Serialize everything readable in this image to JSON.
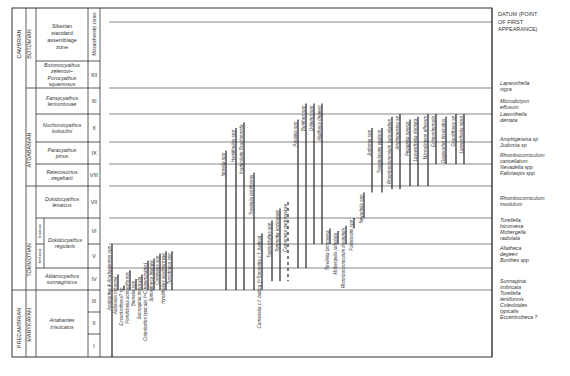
{
  "header": {
    "col_era": "",
    "zone_header": "Siberian standard assemblage zone",
    "miss_header": "Missarzhevsky zones",
    "datum_header": [
      "DATUM (POINT",
      "OF FIRST",
      "APPEARANCE)"
    ]
  },
  "systems": [
    {
      "label": "CAMBRIAN",
      "from": 0,
      "to": 12
    },
    {
      "label": "PRECAMBRIAN",
      "from": 12,
      "to": 15
    }
  ],
  "stages": [
    {
      "label": "BOTOMIAN",
      "from": 0,
      "to": 1
    },
    {
      "label": "ATDABANIAN",
      "from": 1,
      "to": 6
    },
    {
      "label": "TOMMOTIAN",
      "from": 6,
      "to": 10
    },
    {
      "label": "MANYKAYAN",
      "from": 10,
      "to": 15
    }
  ],
  "zones": [
    {
      "name": "Botomocyathus zelenovi–Porocyathus squamosus",
      "numeral": "XII"
    },
    {
      "name": "Fansycyathus lermontovae",
      "numeral": "XI"
    },
    {
      "name": "Nochoroicyathus kokoulini",
      "numeral": "X"
    },
    {
      "name": "Paracyathus pinus",
      "numeral": "IX"
    },
    {
      "name": "Retecoscinus zegebarti",
      "numeral": "VIII"
    },
    {
      "name": "Dokidocyathus lenaicus",
      "numeral": "VII"
    },
    {
      "name": "Dokidocyathus regularis",
      "numeral": "VI"
    },
    {
      "name": "Dokidocyathus regularis",
      "numeral": "V"
    },
    {
      "name": "Aldanocyathus sunnaginicus",
      "numeral": "IV"
    },
    {
      "name": "Anabarites trisulcatus",
      "numeral": "III"
    },
    {
      "name": "Anabarites trisulcatus",
      "numeral": "II"
    },
    {
      "name": "Anabarites trisulcatus",
      "numeral": "I"
    }
  ],
  "sub_zones": [
    "lenaicus",
    "tortuosa"
  ],
  "taxa": [
    {
      "name": "Anabarites & Anabarilentus spp",
      "top": 7,
      "bottom": 12
    },
    {
      "name": "Aldanella rozanovi",
      "top": 8.3,
      "bottom": 9
    },
    {
      "name": "Eccentrotheca? sp",
      "top": 8.8,
      "bottom": 9
    },
    {
      "name": "Fomitchella acinaciformis",
      "top": 8.1,
      "bottom": 9
    },
    {
      "name": "Bemella spp",
      "top": 8.5,
      "bottom": 9
    },
    {
      "name": "Sunnaginia imbricata",
      "top": 8.3,
      "bottom": 9
    },
    {
      "name": "Coleoloides typicalis (=C.trigeminatus)",
      "top": 7.7,
      "bottom": 9
    },
    {
      "name": "Spinulitheca billingsi",
      "top": 7.6,
      "bottom": 9
    },
    {
      "name": "Cobdellus spp",
      "top": 7.4,
      "bottom": 9
    },
    {
      "name": "Hyolithellus vladimirovae",
      "top": 7.3,
      "bottom": 9
    },
    {
      "name": "Turcutheca spp",
      "top": 7.3,
      "bottom": 9
    },
    {
      "name": "Igorella spp",
      "top": 3.4,
      "bottom": 9
    },
    {
      "name": "Hyolithellus spp",
      "top": 2.5,
      "bottom": 9
    },
    {
      "name": "Inarticulate Brachiopoda",
      "top": 2.3,
      "bottom": 9
    },
    {
      "name": "Torellella lentiformis",
      "top": 4.4,
      "bottom": 9
    },
    {
      "name": "Camenella c.f. baltica (=Tommotia c.f. baltica)",
      "top": 6.6,
      "bottom": 9
    },
    {
      "name": "Tugolochiltes spp",
      "top": 6.1,
      "bottom": 8.6
    },
    {
      "name": "Tommotia kozlowskii",
      "top": 5.7,
      "bottom": 8.6
    },
    {
      "name": "Camenella garbowskae",
      "top": 5.5,
      "bottom": 8.6
    },
    {
      "name": "Paralilla spp",
      "top": 2.2,
      "bottom": 8
    },
    {
      "name": "Burithes spp",
      "top": 1.6,
      "bottom": 8
    },
    {
      "name": "Doliutus spp",
      "top": 1.6,
      "bottom": 7
    },
    {
      "name": "Allatheca degeeri",
      "top": 1.6,
      "bottom": 7
    },
    {
      "name": "Torellella biconvexa",
      "top": 6.4,
      "bottom": 7
    },
    {
      "name": "Mobergella radiolata",
      "top": 6.5,
      "bottom": 7
    },
    {
      "name": "Rhombocorniculum insolutum",
      "top": 6.3,
      "bottom": 7
    },
    {
      "name": "Fallotaspis spp",
      "top": 6.0,
      "bottom": 6.4
    },
    {
      "name": "Nevadella spp",
      "top": 5.2,
      "bottom": 6
    },
    {
      "name": "Judomia spp",
      "top": 2.5,
      "bottom": 5.2
    },
    {
      "name": "Triangulaspis vigilans",
      "top": 2.5,
      "bottom": 5.2
    },
    {
      "name": "Rhombocorniculum cancellatum",
      "top": 2.1,
      "bottom": 5.1
    },
    {
      "name": "Amphigeisina sp",
      "top": 2.0,
      "bottom": 5.1
    },
    {
      "name": "Pelagiella lorenzi",
      "top": 2.2,
      "bottom": 5
    },
    {
      "name": "Lapworthella dentata",
      "top": 2.1,
      "bottom": 5
    },
    {
      "name": "Microdictyon effusum",
      "top": 2.0,
      "bottom": 5
    },
    {
      "name": "Echinodermata",
      "top": 2.0,
      "bottom": 4
    },
    {
      "name": "Dagaradus bisulcatus",
      "top": 2.1,
      "bottom": 4
    },
    {
      "name": "Gracilitheca sp",
      "top": 2.0,
      "bottom": 4
    },
    {
      "name": "Lapworthella nigra",
      "top": 2.0,
      "bottom": 4
    }
  ],
  "datums": [
    {
      "labels": [
        "Lapworthella",
        "nigra"
      ]
    },
    {
      "labels": [
        "Microdictyon",
        "effusum"
      ]
    },
    {
      "labels": [
        "Lawortheila",
        "dentata"
      ]
    },
    {
      "labels": [
        "Amphigeisina sp",
        "Judomia sp"
      ]
    },
    {
      "labels": [
        "Rhombocorniculum",
        "cancellatum",
        "Nevadella spp"
      ]
    },
    {
      "labels": [
        "Fallotaspis spp"
      ]
    },
    {
      "labels": [
        "Rhombocorniculum",
        "insolutum"
      ]
    },
    {
      "labels": [
        "Torellella",
        "biconvexa",
        "Mobergella",
        "radiolata"
      ]
    },
    {
      "labels": [
        "Allatheca",
        "degeeri"
      ]
    },
    {
      "labels": [
        "Burithes spp"
      ]
    },
    {
      "labels": [
        "Sunnaginia",
        "imbricata",
        "Torellella",
        "lentiformis",
        "Coleoloides",
        "typicalis",
        "Eccentrotheca ?"
      ]
    }
  ],
  "caption": {
    "fig": "Fig. 5.8",
    "text": "Stratigraphic ranges of early fossil groups across the Precambrian–Cambrian boundary"
  }
}
